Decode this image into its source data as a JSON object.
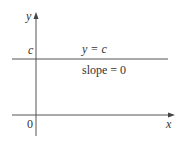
{
  "diagram": {
    "axes": {
      "x_label": "x",
      "y_label": "y",
      "origin_label": "0"
    },
    "line": {
      "equation": "y = c",
      "slope_text": "slope = 0",
      "intercept_label": "c"
    },
    "colors": {
      "axis": "#555555",
      "line": "#555555",
      "text": "#333333"
    }
  }
}
